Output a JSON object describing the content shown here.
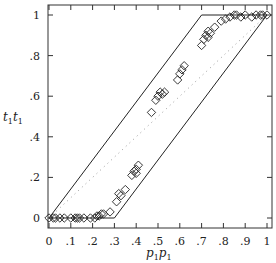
{
  "chart_data": {
    "type": "scatter",
    "title": "",
    "xlabel": "p1p1",
    "ylabel": "t1t1",
    "xlim": [
      0,
      1
    ],
    "ylim": [
      0,
      1
    ],
    "grid": false,
    "legend": null,
    "x_ticks": [
      "0",
      ".1",
      ".2",
      ".3",
      ".4",
      ".5",
      ".6",
      ".7",
      ".8",
      ".9",
      "1"
    ],
    "y_ticks": [
      "0",
      ".2",
      ".4",
      ".6",
      ".8",
      "1"
    ],
    "series": [
      {
        "name": "observations",
        "marker": "diamond-open",
        "points": [
          [
            0.0,
            0.0
          ],
          [
            0.02,
            0.0
          ],
          [
            0.03,
            0.0
          ],
          [
            0.05,
            0.0
          ],
          [
            0.07,
            0.0
          ],
          [
            0.1,
            0.0
          ],
          [
            0.12,
            0.0
          ],
          [
            0.13,
            0.0
          ],
          [
            0.14,
            0.0
          ],
          [
            0.16,
            0.0
          ],
          [
            0.19,
            0.0
          ],
          [
            0.21,
            0.0
          ],
          [
            0.22,
            0.01
          ],
          [
            0.23,
            0.01
          ],
          [
            0.24,
            0.02
          ],
          [
            0.25,
            0.02
          ],
          [
            0.28,
            0.03
          ],
          [
            0.31,
            0.08
          ],
          [
            0.32,
            0.12
          ],
          [
            0.33,
            0.11
          ],
          [
            0.35,
            0.14
          ],
          [
            0.38,
            0.21
          ],
          [
            0.39,
            0.23
          ],
          [
            0.4,
            0.22
          ],
          [
            0.4,
            0.24
          ],
          [
            0.41,
            0.26
          ],
          [
            0.47,
            0.52
          ],
          [
            0.49,
            0.58
          ],
          [
            0.5,
            0.6
          ],
          [
            0.51,
            0.62
          ],
          [
            0.52,
            0.61
          ],
          [
            0.53,
            0.62
          ],
          [
            0.59,
            0.68
          ],
          [
            0.6,
            0.71
          ],
          [
            0.61,
            0.73
          ],
          [
            0.62,
            0.75
          ],
          [
            0.7,
            0.85
          ],
          [
            0.71,
            0.88
          ],
          [
            0.72,
            0.9
          ],
          [
            0.73,
            0.92
          ],
          [
            0.74,
            0.91
          ],
          [
            0.73,
            0.89
          ],
          [
            0.76,
            0.94
          ],
          [
            0.79,
            0.97
          ],
          [
            0.81,
            0.98
          ],
          [
            0.83,
            0.99
          ],
          [
            0.85,
            1.0
          ],
          [
            0.86,
            1.0
          ],
          [
            0.88,
            0.99
          ],
          [
            0.9,
            1.0
          ],
          [
            0.93,
            0.99
          ],
          [
            0.95,
            1.0
          ],
          [
            0.97,
            1.0
          ],
          [
            0.98,
            1.0
          ],
          [
            1.0,
            1.0
          ]
        ]
      },
      {
        "name": "upper-bound",
        "style": "solid",
        "points": [
          [
            0,
            0
          ],
          [
            0.7,
            1
          ],
          [
            1,
            1
          ]
        ]
      },
      {
        "name": "lower-bound",
        "style": "solid",
        "points": [
          [
            0,
            0
          ],
          [
            0.3,
            0
          ],
          [
            1,
            1
          ]
        ]
      },
      {
        "name": "diagonal",
        "style": "dotted",
        "points": [
          [
            0,
            0
          ],
          [
            1,
            1
          ]
        ]
      }
    ]
  },
  "labels": {
    "xlabel_main": "p",
    "xlabel_sub": "1",
    "ylabel_main": "t",
    "ylabel_sub": "1"
  }
}
